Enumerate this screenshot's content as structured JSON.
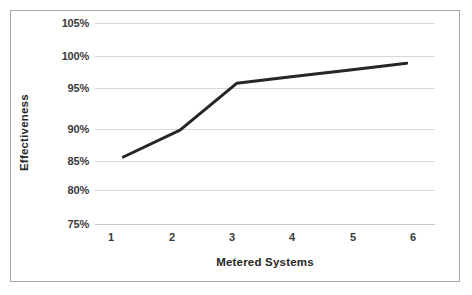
{
  "chart_data": {
    "type": "line",
    "title": "",
    "xlabel": "Metered Systems",
    "ylabel": "Effectiveness",
    "x": [
      1,
      2,
      3,
      4,
      5,
      6
    ],
    "categories": [
      "1",
      "2",
      "3",
      "4",
      "5",
      "6"
    ],
    "series": [
      {
        "name": "Effectiveness",
        "values": [
          85,
          89,
          96,
          97,
          98,
          99
        ],
        "color": "#262626",
        "line_width": 3,
        "markers": false
      }
    ],
    "xlim": [
      0.5,
      6.5
    ],
    "ylim": [
      75,
      105
    ],
    "ytick_values": [
      75,
      80,
      85,
      90,
      95,
      100,
      105
    ],
    "ytick_labels": [
      "75%",
      "80%",
      "85%",
      "90%",
      "95%",
      "100%",
      "105%"
    ],
    "xtick_labels": [
      "1",
      "2",
      "3",
      "4",
      "5",
      "6"
    ],
    "grid": "horizontal",
    "gridline_color": "#d9d9d9",
    "legend": "none",
    "border_color": "#a6a6a6",
    "background": "#ffffff"
  },
  "axes": {
    "y_labels": [
      {
        "text": "105%",
        "value": 105
      },
      {
        "text": "100%",
        "value": 100
      },
      {
        "text": "95%",
        "value": 95
      },
      {
        "text": "90%",
        "value": 90
      },
      {
        "text": "85%",
        "value": 85
      },
      {
        "text": "80%",
        "value": 80
      },
      {
        "text": "75%",
        "value": 75
      }
    ],
    "x_labels": [
      {
        "text": "1"
      },
      {
        "text": "2"
      },
      {
        "text": "3"
      },
      {
        "text": "4"
      },
      {
        "text": "5"
      },
      {
        "text": "6"
      }
    ],
    "x_title": "Metered Systems",
    "y_title": "Effectiveness"
  }
}
